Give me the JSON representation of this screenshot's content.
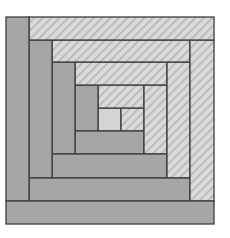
{
  "diagram": {
    "colors": {
      "background": "#ffffff",
      "dark_fill": "#a6a6a6",
      "light_fill": "#dadada",
      "hatch_line": "#b4b4b4",
      "center_fill": "#d4d4d4",
      "stroke": "#3c3c3c"
    },
    "pieces": [
      {
        "id": "center",
        "type": "center",
        "x": 98,
        "y": 108,
        "w": 23,
        "h": 23
      },
      {
        "id": "r1-right-light",
        "type": "light",
        "x": 121,
        "y": 108,
        "w": 23,
        "h": 23
      },
      {
        "id": "r1-top-light",
        "type": "light",
        "x": 98,
        "y": 85,
        "w": 46,
        "h": 23
      },
      {
        "id": "r1-left-dark",
        "type": "dark",
        "x": 75,
        "y": 85,
        "w": 23,
        "h": 46
      },
      {
        "id": "r1-bottom-dark",
        "type": "dark",
        "x": 75,
        "y": 131,
        "w": 69,
        "h": 23
      },
      {
        "id": "r2-right-light",
        "type": "light",
        "x": 144,
        "y": 85,
        "w": 23,
        "h": 69
      },
      {
        "id": "r2-top-light",
        "type": "light",
        "x": 75,
        "y": 62,
        "w": 92,
        "h": 23
      },
      {
        "id": "r2-left-dark",
        "type": "dark",
        "x": 52,
        "y": 62,
        "w": 23,
        "h": 92
      },
      {
        "id": "r2-bottom-dark",
        "type": "dark",
        "x": 52,
        "y": 154,
        "w": 115,
        "h": 24
      },
      {
        "id": "r3-right-light",
        "type": "light",
        "x": 167,
        "y": 62,
        "w": 23,
        "h": 116
      },
      {
        "id": "r3-top-light",
        "type": "light",
        "x": 52,
        "y": 40,
        "w": 138,
        "h": 22
      },
      {
        "id": "r3-left-dark",
        "type": "dark",
        "x": 29,
        "y": 40,
        "w": 23,
        "h": 138
      },
      {
        "id": "r3-bottom-dark",
        "type": "dark",
        "x": 29,
        "y": 178,
        "w": 161,
        "h": 23
      },
      {
        "id": "r4-right-light",
        "type": "light",
        "x": 190,
        "y": 40,
        "w": 24,
        "h": 161
      },
      {
        "id": "r4-top-light",
        "type": "light",
        "x": 29,
        "y": 17,
        "w": 185,
        "h": 23
      },
      {
        "id": "r4-left-dark",
        "type": "dark",
        "x": 6,
        "y": 17,
        "w": 23,
        "h": 184
      },
      {
        "id": "r4-bottom-dark",
        "type": "dark",
        "x": 6,
        "y": 201,
        "w": 208,
        "h": 23
      }
    ]
  }
}
